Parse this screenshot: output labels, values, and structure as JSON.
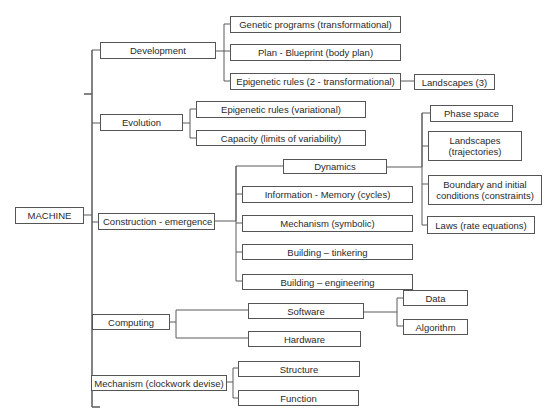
{
  "diagram": {
    "root": "MACHINE",
    "level1": {
      "development": "Development",
      "evolution": "Evolution",
      "construction": "Construction - emergence",
      "computing": "Computing",
      "mechanism": "Mechanism (clockwork devise)"
    },
    "development": {
      "genetic_programs": "Genetic programs (transformational)",
      "plan": "Plan - Blueprint (body plan)",
      "epigenetic_rules": "Epigenetic rules (2 - transformational)",
      "landscapes": "Landscapes (3)"
    },
    "evolution": {
      "epigenetic_rules": "Epigenetic rules (variational)",
      "capacity": "Capacity (limits of variability)"
    },
    "construction": {
      "dynamics": "Dynamics",
      "information": "Information - Memory (cycles)",
      "mechanism": "Mechanism (symbolic)",
      "tinkering": "Building – tinkering",
      "engineering": "Building – engineering"
    },
    "dynamics": {
      "phase_space": "Phase space",
      "landscapes": "Landscapes (trajectories)",
      "boundary": "Boundary and initial conditions (constraints)",
      "laws": "Laws (rate equations)"
    },
    "computing": {
      "software": "Software",
      "hardware": "Hardware"
    },
    "software": {
      "data": "Data",
      "algorithm": "Algorithm"
    },
    "mechanism": {
      "structure": "Structure",
      "function": "Function"
    }
  }
}
